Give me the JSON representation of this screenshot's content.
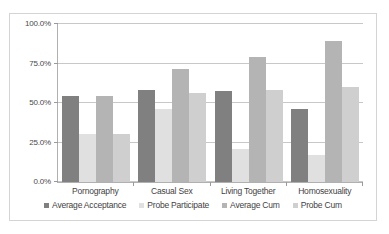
{
  "chart_data": {
    "type": "bar",
    "title": "",
    "xlabel": "",
    "ylabel": "",
    "ylim": [
      0,
      100
    ],
    "yticks": [
      0,
      25,
      50,
      75,
      100
    ],
    "ytick_labels": [
      "0.0%",
      "25.0%",
      "50.0%",
      "75.0%",
      "100.0%"
    ],
    "grid": true,
    "legend_position": "bottom",
    "categories": [
      "Pornography",
      "Casual Sex",
      "Living Together",
      "Homosexuality"
    ],
    "series": [
      {
        "name": "Average Acceptance",
        "color": "#808080",
        "values": [
          54.5,
          58.5,
          57.5,
          46.5
        ]
      },
      {
        "name": "Probe Participate",
        "color": "#e0e0e0",
        "values": [
          30.5,
          46.5,
          21.0,
          17.0
        ]
      },
      {
        "name": "Average Cum",
        "color": "#b4b4b4",
        "values": [
          54.5,
          71.5,
          79.0,
          89.5
        ]
      },
      {
        "name": "Probe Cum",
        "color": "#cfcfcf",
        "values": [
          30.5,
          56.5,
          58.5,
          60.0
        ]
      }
    ]
  },
  "axis": {
    "y_labels": [
      "100.0%",
      "75.0%",
      "50.0%",
      "25.0%",
      "0.0%"
    ]
  },
  "legend": {
    "items": [
      {
        "label": "Average Acceptance"
      },
      {
        "label": "Probe Participate"
      },
      {
        "label": "Average Cum"
      },
      {
        "label": "Probe Cum"
      }
    ]
  }
}
